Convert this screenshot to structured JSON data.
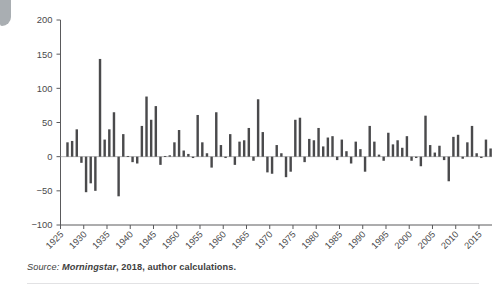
{
  "figure": {
    "caption_label": "Source:",
    "caption_source": " Morningstar",
    "caption_rest": ", 2018, author calculations."
  },
  "chart_data": {
    "type": "bar",
    "title": "",
    "subtitle": "",
    "xlabel": "",
    "ylabel": "",
    "grid": false,
    "legend": "none",
    "ylim": [
      -100,
      200
    ],
    "ytick_values": [
      -100,
      -50,
      0,
      50,
      100,
      150,
      200
    ],
    "ytick_labels": [
      "−100",
      "−50",
      "0",
      "50",
      "100",
      "150",
      "200"
    ],
    "xtick_values": [
      1925,
      1930,
      1935,
      1940,
      1945,
      1950,
      1955,
      1960,
      1965,
      1970,
      1975,
      1980,
      1985,
      1990,
      1995,
      2000,
      2005,
      2010,
      2015
    ],
    "xtick_labels": [
      "1925",
      "1930",
      "1935",
      "1940",
      "1945",
      "1950",
      "1955",
      "1960",
      "1965",
      "1970",
      "1975",
      "1980",
      "1985",
      "1990",
      "1995",
      "2000",
      "2005",
      "2010",
      "2015"
    ],
    "xlim": [
      1925.0,
      2017.8
    ],
    "bar_color": "#4a4a4c",
    "axis_color": "#5a5a5c",
    "categories": [
      1926,
      1927,
      1928,
      1929,
      1930,
      1931,
      1932,
      1933,
      1934,
      1935,
      1936,
      1937,
      1938,
      1939,
      1940,
      1941,
      1942,
      1943,
      1944,
      1945,
      1946,
      1947,
      1948,
      1949,
      1950,
      1951,
      1952,
      1953,
      1954,
      1955,
      1956,
      1957,
      1958,
      1959,
      1960,
      1961,
      1962,
      1963,
      1964,
      1965,
      1966,
      1967,
      1968,
      1969,
      1970,
      1971,
      1972,
      1973,
      1974,
      1975,
      1976,
      1977,
      1978,
      1979,
      1980,
      1981,
      1982,
      1983,
      1984,
      1985,
      1986,
      1987,
      1988,
      1989,
      1990,
      1991,
      1992,
      1993,
      1994,
      1995,
      1996,
      1997,
      1998,
      1999,
      2000,
      2001,
      2002,
      2003,
      2004,
      2005,
      2006,
      2007,
      2008,
      2009,
      2010,
      2011,
      2012,
      2013,
      2014,
      2015,
      2016,
      2017
    ],
    "values": [
      21,
      23,
      40,
      -9,
      -52,
      -39,
      -50,
      143,
      25,
      40,
      65,
      -58,
      33,
      1,
      -8,
      -10,
      45,
      88,
      54,
      74,
      -12,
      1,
      2,
      21,
      39,
      9,
      4,
      -2,
      61,
      21,
      5,
      -16,
      65,
      17,
      -2,
      33,
      -12,
      22,
      24,
      42,
      -6,
      84,
      36,
      -23,
      -25,
      17,
      5,
      -30,
      -22,
      54,
      57,
      -8,
      26,
      24,
      42,
      15,
      28,
      30,
      -5,
      25,
      8,
      -10,
      22,
      11,
      -22,
      45,
      22,
      3,
      -6,
      35,
      18,
      24,
      13,
      30,
      -6,
      -2,
      -14,
      60,
      17,
      6,
      16,
      -5,
      -36,
      29,
      32,
      -3,
      21,
      45,
      5,
      -2,
      25,
      12
    ],
    "value_units": "percent",
    "bar_count": 92
  }
}
